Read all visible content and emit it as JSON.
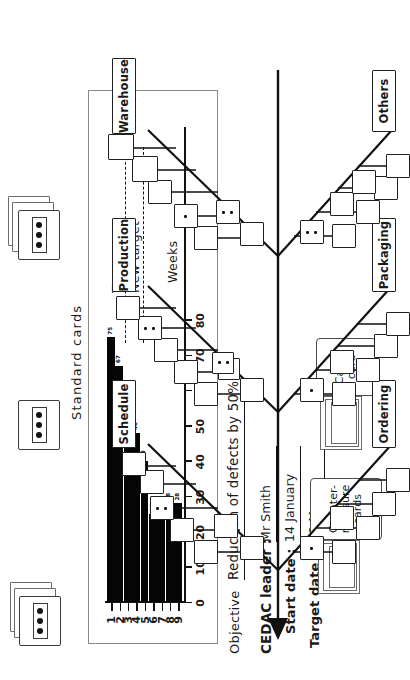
{
  "page": {
    "standard_cards_label": "Standard cards",
    "objective_label": "Objective",
    "objective_value": "Reduction of defects by 50%",
    "leader_label": "CEDAC leader :",
    "leader_value": "Mr Smith",
    "start_label": "Start date :",
    "start_value": "14 January",
    "target_label": "Target date :",
    "target_value": "18 May"
  },
  "legend": {
    "cause_card": "Cause\ncard",
    "countermeasure_card": "Counter-\nmeasure\ncards"
  },
  "chart_data": {
    "type": "bar",
    "title": "",
    "xlabel": "Weeks",
    "ylabel": "",
    "categories": [
      "1",
      "2",
      "3",
      "4",
      "5",
      "6",
      "7",
      "8",
      "9"
    ],
    "values": [
      75,
      67,
      57,
      48,
      40,
      25,
      30,
      28,
      28
    ],
    "bar_labels": [
      "75",
      "67",
      "57",
      "48",
      "40",
      "25",
      "30",
      "28",
      "28"
    ],
    "ytick_labels": [
      "80",
      "70",
      "60",
      "50",
      "40",
      "30",
      "20",
      "10",
      "0"
    ],
    "yticks": [
      80,
      70,
      60,
      50,
      40,
      30,
      20,
      10,
      0
    ],
    "ylim": [
      0,
      85
    ],
    "grid": false,
    "legend_position": "inside-right",
    "annotations": [
      {
        "label": "Target",
        "type": "dashed-line"
      },
      {
        "label": "New target",
        "type": "dashed-line"
      }
    ]
  },
  "fishbone": {
    "categories_top": [
      "Schedule",
      "Production",
      "Warehouse"
    ],
    "categories_bottom": [
      "Ordering",
      "Packaging",
      "Others"
    ]
  },
  "colors": {
    "ink": "#111111",
    "bar_fill": "#050505",
    "frame": "#8a8a8a",
    "box_border": "#222222"
  }
}
